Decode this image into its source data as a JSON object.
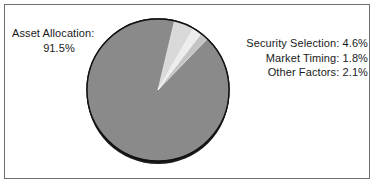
{
  "figure": {
    "background_color": "#ffffff",
    "border_color": "#6e6e6e"
  },
  "left_label": {
    "line1": "Asset Allocation:",
    "line2": "91.5%"
  },
  "right_labels": [
    {
      "text": "Security Selection: 4.6%"
    },
    {
      "text": "Market Timing: 1.8%"
    },
    {
      "text": "Other Factors: 2.1%"
    }
  ],
  "chart_data": {
    "type": "pie",
    "title": "",
    "labels": [
      "Asset Allocation",
      "Security Selection",
      "Other Factors",
      "Market Timing"
    ],
    "values": [
      91.5,
      4.6,
      2.1,
      1.8
    ],
    "value_suffix": "%",
    "colors": [
      "#8a8a8a",
      "#d9d9d9",
      "#ededed",
      "#c4c4c4"
    ],
    "legend": "none",
    "annotations": [
      "Asset Allocation: 91.5%",
      "Security Selection: 4.6%",
      "Market Timing: 1.8%",
      "Other Factors: 2.1%"
    ],
    "start_angle_deg": -46,
    "direction": "clockwise",
    "center": [
      158,
      90
    ],
    "radius": 71,
    "outline_color": "#111111",
    "has_3d_shadow": true
  }
}
